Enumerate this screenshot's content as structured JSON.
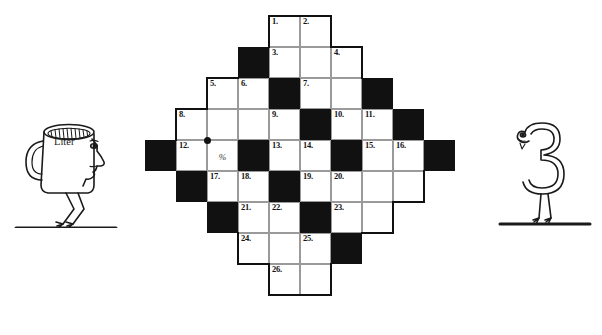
{
  "page": {
    "background_color": "#ffffff",
    "ink_color": "#111111",
    "grid_line_color": "#9a9a9a"
  },
  "crossword": {
    "name": "diamond-shaped-crossword-grid",
    "columns": 11,
    "rows": 9,
    "cell_size_px": 31,
    "origin_px": {
      "x": 145,
      "y": 16
    },
    "marker_dot": {
      "col": 2,
      "row": 4,
      "position": "top-left-corner"
    },
    "cells": [
      [
        null,
        null,
        null,
        null,
        {
          "t": "w",
          "n": "1."
        },
        {
          "t": "w",
          "n": "2."
        },
        null,
        null,
        null,
        null,
        null
      ],
      [
        null,
        null,
        null,
        {
          "t": "b"
        },
        {
          "t": "w",
          "n": "3."
        },
        {
          "t": "w"
        },
        {
          "t": "w",
          "n": "4."
        },
        null,
        null,
        null,
        null
      ],
      [
        null,
        null,
        {
          "t": "w",
          "n": "5."
        },
        {
          "t": "w",
          "n": "6."
        },
        {
          "t": "b"
        },
        {
          "t": "w",
          "n": "7."
        },
        {
          "t": "w"
        },
        {
          "t": "b"
        },
        null,
        null,
        null
      ],
      [
        null,
        {
          "t": "w",
          "n": "8."
        },
        {
          "t": "w"
        },
        {
          "t": "w"
        },
        {
          "t": "w",
          "n": "9."
        },
        {
          "t": "b"
        },
        {
          "t": "w",
          "n": "10."
        },
        {
          "t": "w",
          "n": "11."
        },
        {
          "t": "b"
        },
        null,
        null
      ],
      [
        {
          "t": "b"
        },
        {
          "t": "w",
          "n": "12."
        },
        {
          "t": "w",
          "m": "%"
        },
        {
          "t": "b"
        },
        {
          "t": "w",
          "n": "13."
        },
        {
          "t": "w",
          "n": "14."
        },
        {
          "t": "b"
        },
        {
          "t": "w",
          "n": "15."
        },
        {
          "t": "w",
          "n": "16."
        },
        {
          "t": "b"
        },
        null
      ],
      [
        null,
        {
          "t": "b"
        },
        {
          "t": "w",
          "n": "17."
        },
        {
          "t": "w",
          "n": "18."
        },
        {
          "t": "b"
        },
        {
          "t": "w",
          "n": "19."
        },
        {
          "t": "w",
          "n": "20."
        },
        {
          "t": "w"
        },
        {
          "t": "w"
        },
        null,
        null
      ],
      [
        null,
        null,
        {
          "t": "b"
        },
        {
          "t": "w",
          "n": "21."
        },
        {
          "t": "w",
          "n": "22."
        },
        {
          "t": "b"
        },
        {
          "t": "w",
          "n": "23."
        },
        {
          "t": "w"
        },
        null,
        null,
        null
      ],
      [
        null,
        null,
        null,
        {
          "t": "w",
          "n": "24."
        },
        {
          "t": "w"
        },
        {
          "t": "w",
          "n": "25."
        },
        {
          "t": "b"
        },
        null,
        null,
        null,
        null
      ],
      [
        null,
        null,
        null,
        null,
        {
          "t": "w",
          "n": "26."
        },
        {
          "t": "w"
        },
        null,
        null,
        null,
        null,
        null
      ]
    ],
    "clue_numbers": [
      "1.",
      "2.",
      "3.",
      "4.",
      "5.",
      "6.",
      "7.",
      "8.",
      "9.",
      "10.",
      "11.",
      "12.",
      "13.",
      "14.",
      "15.",
      "16.",
      "17.",
      "18.",
      "19.",
      "20.",
      "21.",
      "22.",
      "23.",
      "24.",
      "25.",
      "26."
    ],
    "symbols": {
      "percent": "%"
    }
  },
  "illustrations": {
    "left": {
      "name": "measuring-cup-character",
      "label": "Liter",
      "description": "cartoon measuring cup with a face in profile standing on a line"
    },
    "right": {
      "name": "numeral-three-character",
      "label": "3",
      "description": "cartoon numeral three with a face standing on a line"
    }
  }
}
